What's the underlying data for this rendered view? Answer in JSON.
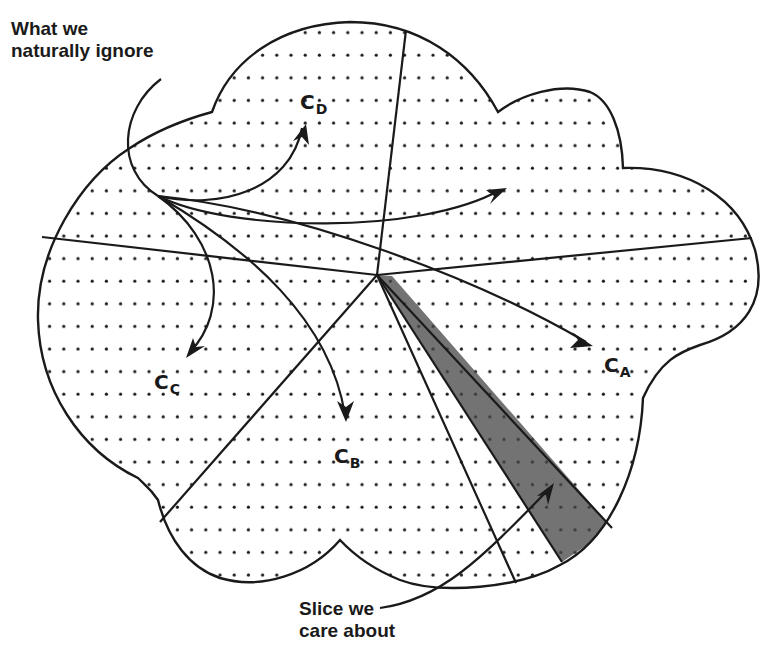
{
  "diagram": {
    "type": "cloud-partition",
    "annotations": {
      "ignore_label": [
        "What we",
        "naturally ignore"
      ],
      "slice_label": [
        "Slice we",
        "care about"
      ]
    },
    "regions": [
      {
        "id": "A",
        "letter": "C",
        "subscript": "A"
      },
      {
        "id": "B",
        "letter": "C",
        "subscript": "B"
      },
      {
        "id": "C",
        "letter": "C",
        "subscript": "C"
      },
      {
        "id": "D",
        "letter": "C",
        "subscript": "D"
      }
    ],
    "colors": {
      "stroke": "#1a1a1a",
      "dots": "#1a1a1a",
      "slice_fill": "#6b6b6b",
      "background": "#ffffff"
    }
  }
}
